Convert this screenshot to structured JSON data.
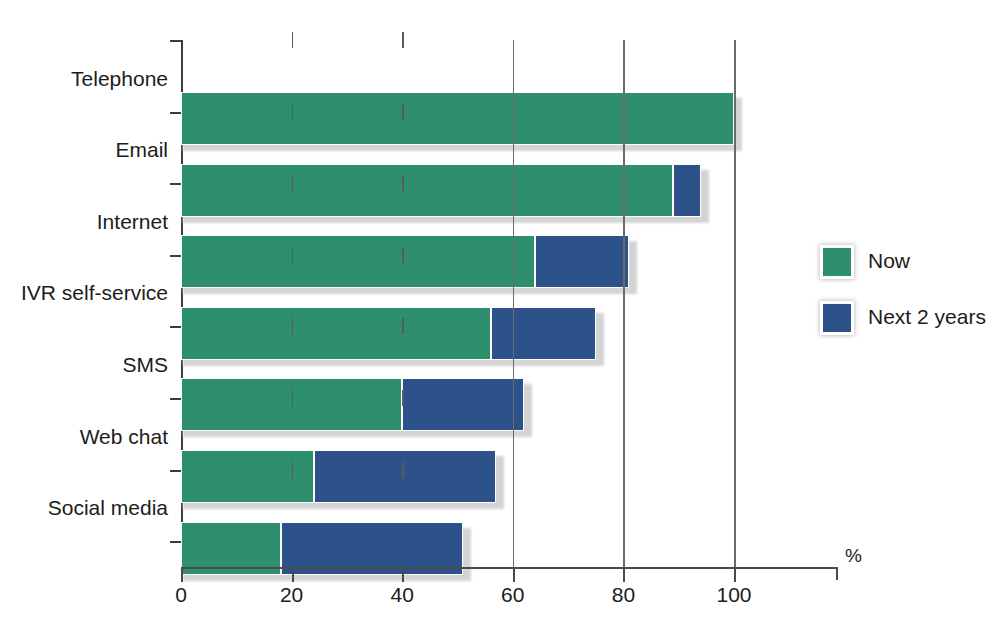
{
  "chart_data": {
    "type": "bar",
    "orientation": "horizontal",
    "stacked": true,
    "title": "",
    "subtitle": "",
    "xlabel": "%",
    "ylabel": "",
    "xlim": [
      0,
      118.8
    ],
    "xticks": [
      0,
      20,
      40,
      60,
      80,
      100
    ],
    "xticklabels": [
      "0",
      "20",
      "40",
      "60",
      "80",
      "100"
    ],
    "gridlines_long_at": [
      60,
      80,
      100
    ],
    "grid": true,
    "legend_position": "right",
    "categories": [
      "Telephone",
      "Email",
      "Internet",
      "IVR self-service",
      "SMS",
      "Web chat",
      "Social media"
    ],
    "series": [
      {
        "name": "Now",
        "color": "#2e8f6e",
        "values": [
          100,
          89,
          64,
          56,
          40,
          24,
          18
        ]
      },
      {
        "name": "Next 2 years",
        "color": "#2d5189",
        "values": [
          0,
          5,
          17,
          19,
          22,
          33,
          33
        ]
      }
    ],
    "cumulative_totals": [
      100,
      94,
      81,
      75,
      62,
      57,
      51
    ],
    "legend": [
      {
        "label": "Now",
        "color": "#2e8f6e"
      },
      {
        "label": "Next 2 years",
        "color": "#2d5189"
      }
    ]
  },
  "axis": {
    "unit_label": "%",
    "tick_labels": [
      "0",
      "20",
      "40",
      "60",
      "80",
      "100"
    ]
  },
  "colors": {
    "now": "#2e8f6e",
    "next": "#2d5189",
    "axis": "#4a4a4a",
    "shadow": "#d2d2d2",
    "background": "#ffffff"
  }
}
